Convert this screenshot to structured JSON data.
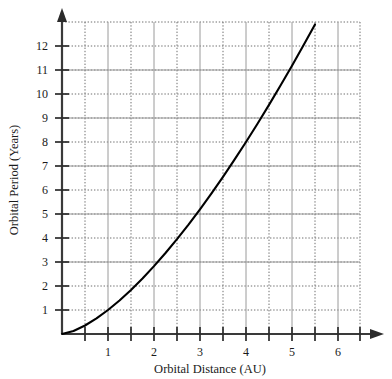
{
  "chart_data": {
    "type": "line",
    "title": "",
    "xlabel": "Orbital Distance (AU)",
    "ylabel": "Orbital Period (Years)",
    "xlim": [
      0,
      6.5
    ],
    "ylim": [
      0,
      12.8
    ],
    "grid": true,
    "legend": null,
    "x_major_ticks": [
      1,
      2,
      3,
      4,
      5,
      6
    ],
    "x_minor_ticks": [
      0.5,
      1.5,
      2.5,
      3.5,
      4.5,
      5.5,
      6.5
    ],
    "x_tick_labels": [
      "1",
      "2",
      "3",
      "4",
      "5",
      "6"
    ],
    "y_major_ticks": [
      1,
      2,
      3,
      4,
      5,
      6,
      7,
      8,
      9,
      10,
      11,
      12
    ],
    "y_tick_labels": [
      "1",
      "2",
      "3",
      "4",
      "5",
      "6",
      "7",
      "8",
      "9",
      "10",
      "11",
      "12"
    ],
    "series": [
      {
        "name": "Kepler third law curve",
        "relation": "period = distance^1.5",
        "x": [
          0,
          0.25,
          0.5,
          0.75,
          1.0,
          1.25,
          1.5,
          1.75,
          2.0,
          2.25,
          2.5,
          2.75,
          3.0,
          3.25,
          3.5,
          3.75,
          4.0,
          4.25,
          4.5,
          4.75,
          5.0,
          5.25,
          5.5
        ],
        "values": [
          0,
          0.125,
          0.354,
          0.65,
          1.0,
          1.398,
          1.837,
          2.315,
          2.828,
          3.375,
          3.953,
          4.56,
          5.196,
          5.859,
          6.548,
          7.262,
          8.0,
          8.762,
          9.546,
          10.353,
          11.18,
          12.03,
          12.9
        ]
      }
    ],
    "curve_color": "#000000",
    "grid_major_color": "#9a9a9a",
    "grid_minor_color": "#6f6f6f",
    "axis_color": "#3a3a3a"
  },
  "axes": {
    "x_title": "Orbital Distance (AU)",
    "y_title": "Orbital Period (Years)"
  },
  "y_labels": {
    "l1": "1",
    "l2": "2",
    "l3": "3",
    "l4": "4",
    "l5": "5",
    "l6": "6",
    "l7": "7",
    "l8": "8",
    "l9": "9",
    "l10": "10",
    "l11": "11",
    "l12": "12"
  },
  "x_labels": {
    "l1": "1",
    "l2": "2",
    "l3": "3",
    "l4": "4",
    "l5": "5",
    "l6": "6"
  }
}
